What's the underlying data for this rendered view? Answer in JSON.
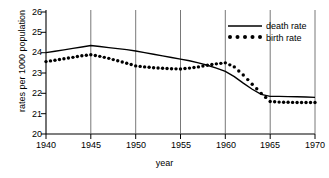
{
  "chart_data": {
    "type": "line",
    "title": "",
    "xlabel": "year",
    "ylabel": "rates per 1000 population",
    "xlim": [
      1940,
      1970
    ],
    "ylim": [
      20,
      26
    ],
    "xticks": [
      1940,
      1945,
      1950,
      1955,
      1960,
      1965,
      1970
    ],
    "yticks": [
      20,
      21,
      22,
      23,
      24,
      25,
      26
    ],
    "grid": "vertical-only",
    "legend_position": "top-right",
    "series": [
      {
        "name": "death rate",
        "style": "solid-line",
        "color": "#000000",
        "x": [
          1940,
          1941,
          1942,
          1943,
          1944,
          1945,
          1946,
          1947,
          1948,
          1949,
          1950,
          1951,
          1952,
          1953,
          1954,
          1955,
          1956,
          1957,
          1958,
          1959,
          1960,
          1961,
          1962,
          1963,
          1964,
          1965,
          1966,
          1967,
          1968,
          1969,
          1970
        ],
        "values": [
          24.0,
          24.07,
          24.14,
          24.21,
          24.28,
          24.35,
          24.3,
          24.25,
          24.2,
          24.15,
          24.08,
          24.0,
          23.92,
          23.84,
          23.76,
          23.68,
          23.6,
          23.5,
          23.38,
          23.24,
          23.08,
          22.82,
          22.5,
          22.2,
          21.95,
          21.85,
          21.85,
          21.84,
          21.83,
          21.82,
          21.8
        ]
      },
      {
        "name": "birth rate",
        "style": "dotted",
        "color": "#000000",
        "x": [
          1940,
          1941,
          1942,
          1943,
          1944,
          1945,
          1946,
          1947,
          1948,
          1949,
          1950,
          1951,
          1952,
          1953,
          1954,
          1955,
          1956,
          1957,
          1958,
          1959,
          1960,
          1961,
          1962,
          1963,
          1964,
          1965,
          1966,
          1967,
          1968,
          1969,
          1970
        ],
        "values": [
          23.56,
          23.63,
          23.7,
          23.77,
          23.85,
          23.9,
          23.82,
          23.72,
          23.6,
          23.48,
          23.35,
          23.3,
          23.26,
          23.23,
          23.21,
          23.2,
          23.24,
          23.3,
          23.38,
          23.45,
          23.5,
          23.3,
          22.9,
          22.45,
          22.0,
          21.6,
          21.57,
          21.56,
          21.55,
          21.55,
          21.55
        ]
      }
    ]
  },
  "axis": {
    "ylabel_text": "rates per 1000 population",
    "xlabel_text": "year",
    "ytick_labels": [
      "26",
      "25",
      "24",
      "23",
      "22",
      "21",
      "20"
    ],
    "xtick_labels": [
      "1940",
      "1945",
      "1950",
      "1955",
      "1960",
      "1965",
      "1970"
    ]
  },
  "legend": {
    "items": [
      {
        "label": "death rate",
        "marker": "line"
      },
      {
        "label": "birth rate",
        "marker": "dots"
      }
    ]
  }
}
